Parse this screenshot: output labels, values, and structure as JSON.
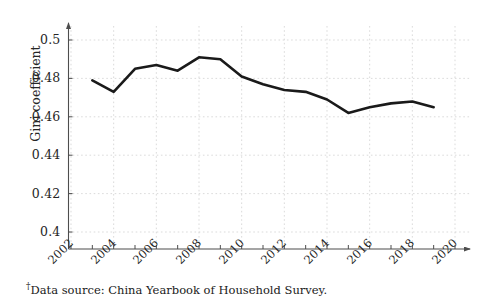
{
  "chart_data": {
    "type": "line",
    "title": "",
    "xlabel": "",
    "ylabel": "Gini coefficient",
    "xlim": [
      2002,
      2020
    ],
    "ylim": [
      0.4,
      0.505
    ],
    "grid": true,
    "legend": null,
    "x": [
      2003,
      2004,
      2005,
      2006,
      2007,
      2008,
      2009,
      2010,
      2011,
      2012,
      2013,
      2014,
      2015,
      2016,
      2017,
      2018,
      2019
    ],
    "values": [
      0.479,
      0.473,
      0.485,
      0.487,
      0.484,
      0.491,
      0.49,
      0.481,
      0.477,
      0.474,
      0.473,
      0.469,
      0.462,
      0.465,
      0.467,
      0.468,
      0.465
    ],
    "series": [
      {
        "name": "Gini coefficient",
        "color": "#1a1a1a",
        "values": [
          0.479,
          0.473,
          0.485,
          0.487,
          0.484,
          0.491,
          0.49,
          0.481,
          0.477,
          0.474,
          0.473,
          0.469,
          0.462,
          0.465,
          0.467,
          0.468,
          0.465
        ]
      }
    ],
    "xticks": [
      2002,
      2004,
      2006,
      2008,
      2010,
      2012,
      2014,
      2016,
      2018,
      2020
    ],
    "xtick_labels": [
      "2002",
      "2004",
      "2006",
      "2008",
      "2010",
      "2012",
      "2014",
      "2016",
      "2018",
      "2020"
    ],
    "yticks": [
      0.4,
      0.42,
      0.44,
      0.46,
      0.48,
      0.5
    ],
    "ytick_labels": [
      "0.4",
      "0.42",
      "0.44",
      "0.46",
      "0.48",
      "0.5"
    ]
  },
  "axis": {
    "y_label": "Gini coefficient"
  },
  "footnote": {
    "marker": "†",
    "text": "Data source: China Yearbook of Household Survey."
  },
  "colors": {
    "line": "#1a1a1a",
    "axis": "#4d4d4d",
    "grid": "#cccccc",
    "text": "#1a1a1a"
  }
}
